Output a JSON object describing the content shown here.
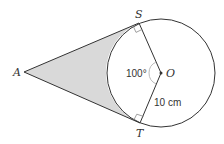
{
  "diagram": {
    "type": "geometry-tangents-circle",
    "colors": {
      "line": "#333333",
      "shading": "#d9d9d9",
      "angle_arc": "#bbbbbb",
      "background": "#ffffff"
    },
    "points": {
      "A": {
        "label": "A",
        "x": 24,
        "y": 72
      },
      "S": {
        "label": "S",
        "x": 139,
        "y": 23
      },
      "T": {
        "label": "T",
        "x": 140,
        "y": 123
      },
      "O": {
        "label": "O",
        "x": 161,
        "y": 73
      }
    },
    "circle": {
      "center": "O",
      "radius_px": 54
    },
    "angle_label": "100°",
    "radius_label": "10 cm",
    "right_angles": [
      "S",
      "T"
    ],
    "shaded_region": "Region between tangents AS, AT and minor arc ST"
  }
}
